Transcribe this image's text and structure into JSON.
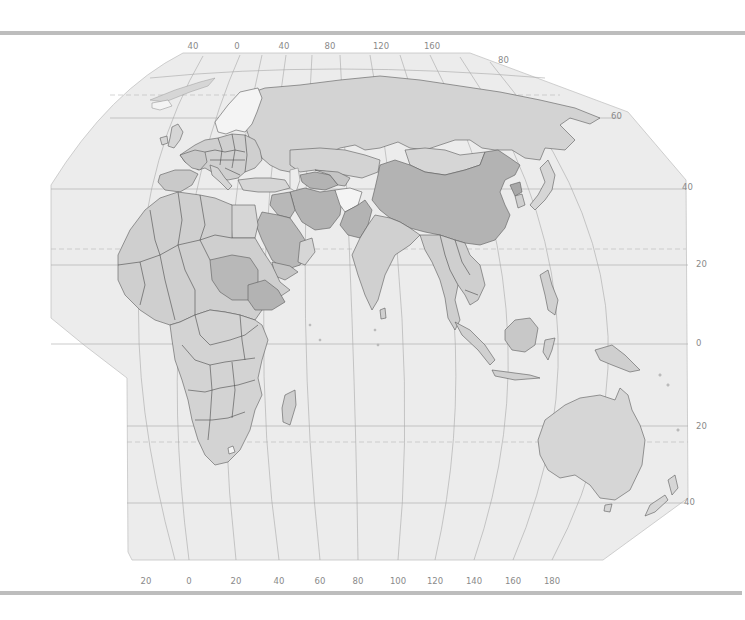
{
  "map": {
    "title": "",
    "region": "Eastern Hemisphere — Europe, Africa, Asia, Oceania",
    "style": "grayscale political map",
    "colors": {
      "ocean_frame": "#ececec",
      "land_light": "#d6d6d6",
      "land_mid": "#c7c7c7",
      "land_dark": "#b3b3b3",
      "land_white": "#f4f4f4",
      "graticule": "#a8a8a8",
      "border": "#4a4a4a",
      "rule": "#bdbdbd",
      "label": "#8a8a8a"
    },
    "top_longitude_labels": [
      {
        "text": "40",
        "x": 193
      },
      {
        "text": "0",
        "x": 237
      },
      {
        "text": "40",
        "x": 284
      },
      {
        "text": "80",
        "x": 330
      },
      {
        "text": "120",
        "x": 381
      },
      {
        "text": "160",
        "x": 432
      }
    ],
    "bottom_longitude_labels": [
      {
        "text": "20",
        "x": 146
      },
      {
        "text": "0",
        "x": 189
      },
      {
        "text": "20",
        "x": 236
      },
      {
        "text": "40",
        "x": 279
      },
      {
        "text": "60",
        "x": 320
      },
      {
        "text": "80",
        "x": 358
      },
      {
        "text": "100",
        "x": 398
      },
      {
        "text": "120",
        "x": 435
      },
      {
        "text": "140",
        "x": 474
      },
      {
        "text": "160",
        "x": 513
      },
      {
        "text": "180",
        "x": 552
      }
    ],
    "right_latitude_labels": [
      {
        "text": "80",
        "x": 500,
        "y": 60
      },
      {
        "text": "60",
        "x": 612,
        "y": 117
      },
      {
        "text": "40",
        "x": 682,
        "y": 187
      },
      {
        "text": "20",
        "x": 696,
        "y": 265
      },
      {
        "text": "0",
        "x": 696,
        "y": 344
      },
      {
        "text": "20",
        "x": 696,
        "y": 427
      },
      {
        "text": "40",
        "x": 684,
        "y": 503
      }
    ],
    "highlighted_countries": {
      "dark": [
        "China",
        "Sudan",
        "Ethiopia",
        "Saudi Arabia",
        "Iran",
        "Iraq",
        "Pakistan",
        "North Korea",
        "Turkmenistan"
      ],
      "white": [
        "Norway",
        "Sweden",
        "Finland",
        "Afghanistan",
        "Lesotho",
        "Swaziland"
      ]
    }
  }
}
